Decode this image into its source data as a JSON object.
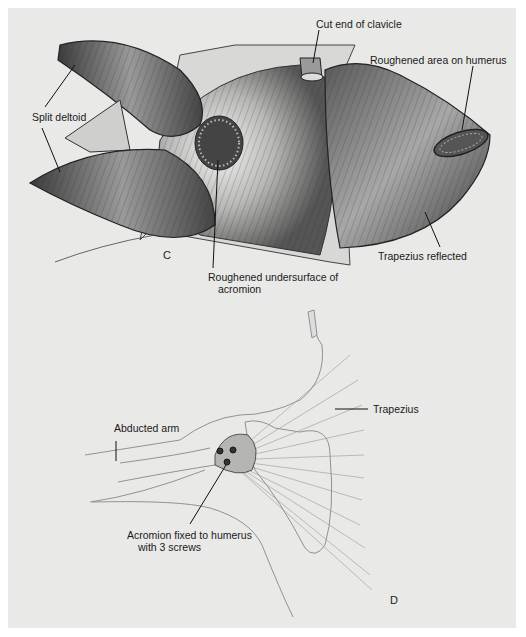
{
  "figure_c": {
    "panel_letter": "C",
    "labels": {
      "cut_end_clavicle": "Cut end of clavicle",
      "roughened_humerus": "Roughened area on humerus",
      "split_deltoid": "Split deltoid",
      "roughened_acromion_line1": "Roughened undersurface of",
      "roughened_acromion_line2": "acromion",
      "trapezius_reflected": "Trapezius reflected"
    }
  },
  "figure_d": {
    "panel_letter": "D",
    "labels": {
      "trapezius": "Trapezius",
      "abducted_arm": "Abducted arm",
      "acromion_fixed_line1": "Acromion fixed to humerus",
      "acromion_fixed_line2": "with 3 screws"
    }
  },
  "colors": {
    "background": "#e9e9e7",
    "muscle_dark": "#3a3a3a",
    "muscle_mid": "#7a7a7a",
    "muscle_light": "#c8c8c6",
    "sketch_line": "#8a8a8a"
  }
}
